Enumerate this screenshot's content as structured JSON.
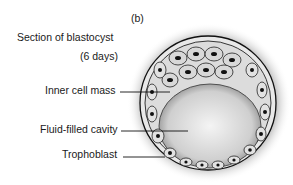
{
  "figure": {
    "panel_label": "(b)",
    "title_line1": "Section of blastocyst",
    "title_line2": "(6 days)"
  },
  "labels": {
    "inner_cell_mass": "Inner cell mass",
    "fluid_filled_cavity": "Fluid-filled cavity",
    "trophoblast": "Trophoblast"
  }
}
